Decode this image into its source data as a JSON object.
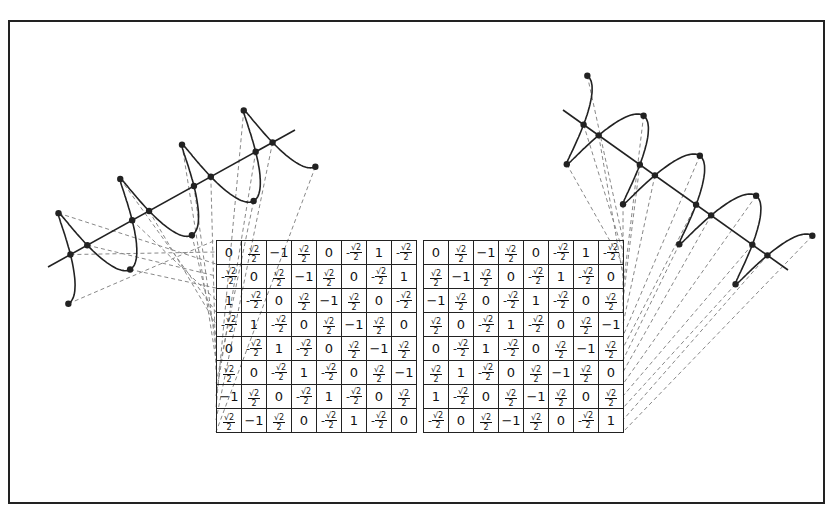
{
  "figure": {
    "frame_color": "#222222",
    "line_color": "#222222",
    "dash_color": "#888888"
  },
  "left_matrix": {
    "rows": [
      [
        "0",
        "√2/2",
        "-1",
        "√2/2",
        "0",
        "-√2/2",
        "1",
        "-√2/2"
      ],
      [
        "-√2/2",
        "0",
        "√2/2",
        "-1",
        "√2/2",
        "0",
        "-√2/2",
        "1"
      ],
      [
        "1",
        "-√2/2",
        "0",
        "√2/2",
        "-1",
        "√2/2",
        "0",
        "-√2/2"
      ],
      [
        "-√2/2",
        "1",
        "-√2/2",
        "0",
        "√2/2",
        "-1",
        "√2/2",
        "0"
      ],
      [
        "0",
        "-√2/2",
        "1",
        "-√2/2",
        "0",
        "√2/2",
        "-1",
        "√2/2"
      ],
      [
        "√2/2",
        "0",
        "-√2/2",
        "1",
        "-√2/2",
        "0",
        "√2/2",
        "-1"
      ],
      [
        "-1",
        "√2/2",
        "0",
        "-√2/2",
        "1",
        "-√2/2",
        "0",
        "√2/2"
      ],
      [
        "√2/2",
        "-1",
        "√2/2",
        "0",
        "-√2/2",
        "1",
        "-√2/2",
        "0"
      ]
    ]
  },
  "right_matrix": {
    "rows": [
      [
        "0",
        "√2/2",
        "-1",
        "√2/2",
        "0",
        "-√2/2",
        "1",
        "-√2/2"
      ],
      [
        "√2/2",
        "-1",
        "√2/2",
        "0",
        "-√2/2",
        "1",
        "-√2/2",
        "0"
      ],
      [
        "-1",
        "√2/2",
        "0",
        "-√2/2",
        "1",
        "-√2/2",
        "0",
        "√2/2"
      ],
      [
        "√2/2",
        "0",
        "-√2/2",
        "1",
        "-√2/2",
        "0",
        "√2/2",
        "-1"
      ],
      [
        "0",
        "-√2/2",
        "1",
        "-√2/2",
        "0",
        "√2/2",
        "-1",
        "√2/2"
      ],
      [
        "√2/2",
        "1",
        "-√2/2",
        "0",
        "√2/2",
        "-1",
        "√2/2",
        "0"
      ],
      [
        "1",
        "-√2/2",
        "0",
        "√2/2",
        "-1",
        "√2/2",
        "0",
        "√2/2"
      ],
      [
        "-√2/2",
        "0",
        "√2/2",
        "-1",
        "√2/2",
        "0",
        "-√2/2",
        "1"
      ]
    ]
  }
}
